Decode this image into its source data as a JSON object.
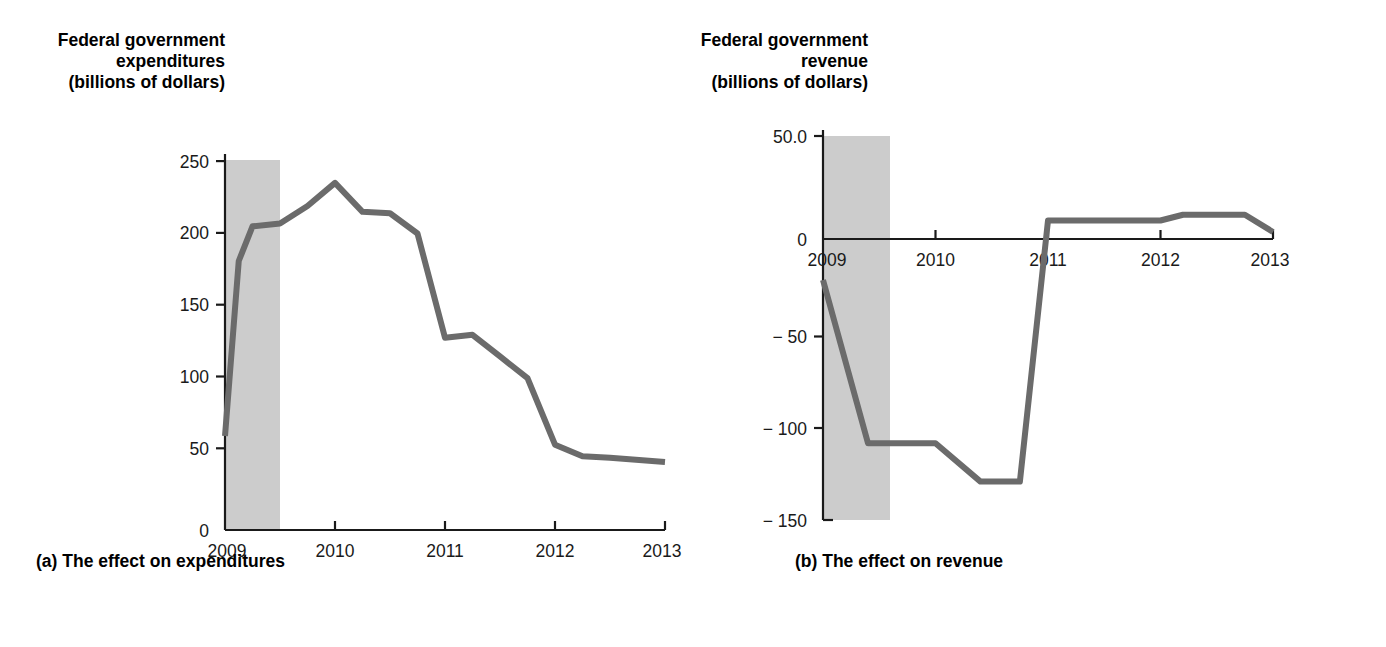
{
  "figure": {
    "panels": [
      {
        "key": "expenditures",
        "axis_title": "Federal government\nexpenditures\n(billions of dollars)",
        "caption": "(a) The effect on expenditures"
      },
      {
        "key": "revenue",
        "axis_title": "Federal government\nrevenue\n(billions of dollars)",
        "caption": "(b) The effect on revenue"
      }
    ],
    "colors": {
      "line": "#6b6b6b",
      "recession_band": "#cccccc",
      "axis": "#1a1a1a",
      "background": "#ffffff"
    }
  },
  "chart_data": [
    {
      "type": "line",
      "title": "Federal government expenditures (billions of dollars)",
      "subtitle": "(a) The effect on expenditures",
      "xlabel": "",
      "ylabel": "Federal government expenditures (billions of dollars)",
      "xlim": [
        2009.0,
        2013.0
      ],
      "ylim": [
        0,
        260
      ],
      "yticks": [
        0,
        50,
        100,
        150,
        200,
        250
      ],
      "ytick_labels": [
        "0",
        "50",
        "100",
        "150",
        "200",
        "250"
      ],
      "xticks": [
        2009,
        2010,
        2011,
        2012,
        2013
      ],
      "xtick_labels": [
        "2009",
        "2010",
        "2011",
        "2012",
        "2013"
      ],
      "grid": false,
      "legend": "none",
      "shaded_region": {
        "label": "recession",
        "x_start": 2009.0,
        "x_end": 2009.5,
        "color": "#cccccc"
      },
      "x": [
        2009.0,
        2009.125,
        2009.25,
        2009.5,
        2009.75,
        2010.0,
        2010.25,
        2010.5,
        2010.75,
        2011.0,
        2011.25,
        2011.5,
        2011.75,
        2012.0,
        2012.25,
        2012.5,
        2013.0
      ],
      "values": [
        65,
        186,
        210,
        212,
        224,
        240,
        220,
        219,
        205,
        133,
        135,
        120,
        105,
        59,
        51,
        50,
        47
      ],
      "series": [
        {
          "name": "Federal government expenditures",
          "values": [
            65,
            186,
            210,
            212,
            224,
            240,
            220,
            219,
            205,
            133,
            135,
            120,
            105,
            59,
            51,
            50,
            47
          ]
        }
      ]
    },
    {
      "type": "line",
      "title": "Federal government revenue (billions of dollars)",
      "subtitle": "(b) The effect on revenue",
      "xlabel": "",
      "ylabel": "Federal government revenue (billions of dollars)",
      "xlim": [
        2009.0,
        2013.0
      ],
      "ylim": [
        -150,
        50
      ],
      "yticks": [
        50,
        0,
        -50,
        -100,
        -150
      ],
      "ytick_labels": [
        "50.0",
        "0",
        "− 50",
        "− 100",
        "− 150"
      ],
      "xticks": [
        2009,
        2010,
        2011,
        2012,
        2013
      ],
      "xtick_labels": [
        "2009",
        "2010",
        "2011",
        "2012",
        "2013"
      ],
      "grid": false,
      "legend": "none",
      "zero_line": true,
      "shaded_region": {
        "label": "recession",
        "x_start": 2009.0,
        "x_end": 2009.5,
        "color": "#cccccc"
      },
      "x": [
        2009.0,
        2009.4,
        2009.75,
        2010.0,
        2010.4,
        2010.75,
        2011.0,
        2011.1,
        2012.0,
        2012.2,
        2012.75,
        2013.0
      ],
      "values": [
        -25,
        -110,
        -110,
        -110,
        -130,
        -130,
        6,
        6,
        6,
        9,
        9,
        0
      ],
      "series": [
        {
          "name": "Federal government revenue",
          "values": [
            -25,
            -110,
            -110,
            -110,
            -130,
            -130,
            6,
            6,
            6,
            9,
            9,
            0
          ]
        }
      ]
    }
  ]
}
